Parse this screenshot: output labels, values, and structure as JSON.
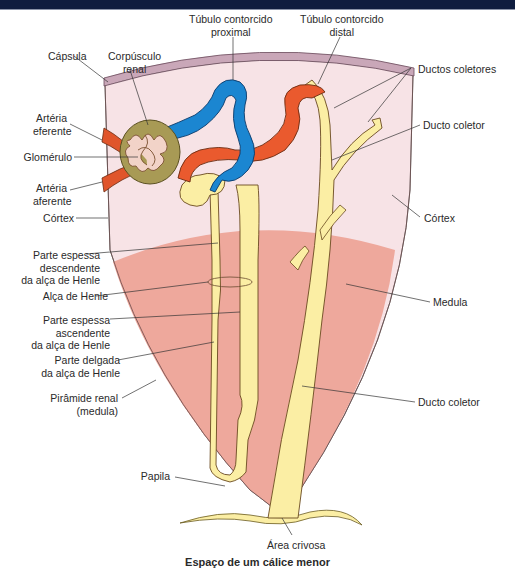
{
  "banner": {
    "color": "#0f1d3f"
  },
  "colors": {
    "capsule": "#c9a7b8",
    "cortex": "#f7e3e6",
    "medulla": "#eea89c",
    "tubule_yellow": "#fbeea4",
    "proximal_blue": "#1b86d1",
    "distal_red": "#ea5a2e",
    "corpuscle": "#a89a55",
    "artery": "#e0552b"
  },
  "labels": {
    "capsula": "Cápsula",
    "corpusculo_renal": [
      "Corpúsculo",
      "renal"
    ],
    "tubulo_proximal": [
      "Túbulo contorcido",
      "proximal"
    ],
    "tubulo_distal": [
      "Túbulo contorcido",
      "distal"
    ],
    "ductos_coletores": "Ductos coletores",
    "ducto_coletor_top": "Ducto coletor",
    "arteria_eferente": [
      "Artéria",
      "eferente"
    ],
    "glomerulo": "Glomérulo",
    "arteria_aferente": [
      "Artéria",
      "aferente"
    ],
    "cortex_left": "Córtex",
    "cortex_right": "Córtex",
    "parte_espessa_desc": [
      "Parte espessa",
      "descendente",
      "da alça de Henle"
    ],
    "alca_henle": "Alça de Henle",
    "medula": "Medula",
    "parte_espessa_asc": [
      "Parte espessa",
      "ascendente",
      "da alça de Henle"
    ],
    "parte_delgada": [
      "Parte delgada",
      "da alça de Henle"
    ],
    "piramide_renal": [
      "Pirâmide renal",
      "(medula)"
    ],
    "ducto_coletor_bottom": "Ducto coletor",
    "papila": "Papila",
    "area_crivosa": "Área crivosa"
  },
  "caption": "Espaço de um cálice menor"
}
